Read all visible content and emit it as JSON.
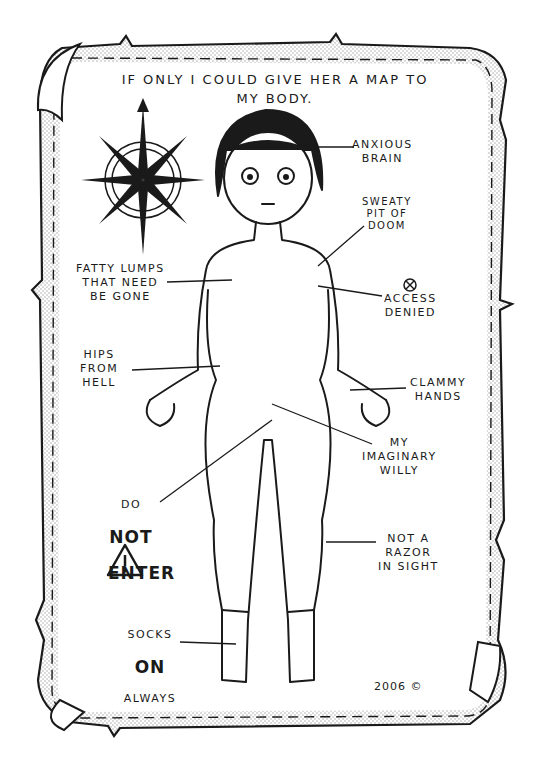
{
  "page": {
    "title": "If only I could give her a map to\nmy body.",
    "credit": "2006 ©"
  },
  "labels": {
    "anxious_brain": "Anxious\nbrain",
    "sweaty_pit": "Sweaty\npit of\ndoom",
    "fatty_lumps": "Fatty lumps\nthat need\nbe gone",
    "access_denied": "Access\ndenied",
    "hips": "Hips\nfrom\nhell",
    "clammy_hands": "Clammy\nhands",
    "imaginary": "My\nimaginary\nwilly",
    "do_not_enter_top": "Do",
    "do_not_enter_mid": "Not",
    "do_not_enter_bottom": "Enter",
    "razor": "Not a\nrazor\nin sight",
    "socks_top": "Socks",
    "socks_mid": "On",
    "socks_bottom": "Always"
  },
  "icons": {
    "compass": "compass-rose-icon",
    "warning": "warning-triangle-icon",
    "no_entry": "crossed-circle-icon"
  },
  "colors": {
    "ink": "#1a1a1a",
    "paper": "#ffffff",
    "stipple": "#bdbdbd"
  }
}
